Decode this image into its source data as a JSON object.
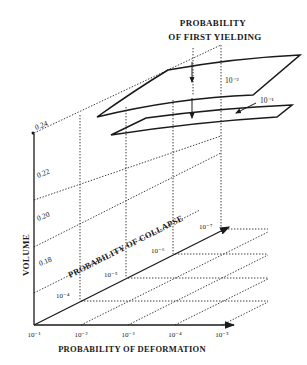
{
  "diagram": {
    "title_line1": "PROBABILITY",
    "title_line2": "OF FIRST YIELDING",
    "axes": {
      "vertical": {
        "label": "VOLUME",
        "ticks": [
          "0.18",
          "0.20",
          "0.22",
          "0.24"
        ]
      },
      "horizontal": {
        "label": "PROBABILITY OF DEFORMATION",
        "ticks": [
          "10⁻¹",
          "10⁻²",
          "10⁻³",
          "10⁻⁴",
          "10⁻⁵"
        ]
      },
      "depth": {
        "label": "PROBABILITY OF COLLAPSE",
        "ticks": [
          "10⁻⁴",
          "10⁻⁵",
          "10⁻⁶",
          "10⁻⁷"
        ]
      }
    },
    "surfaces": [
      {
        "label": "10⁻²"
      },
      {
        "label": "10⁻¹"
      }
    ]
  }
}
